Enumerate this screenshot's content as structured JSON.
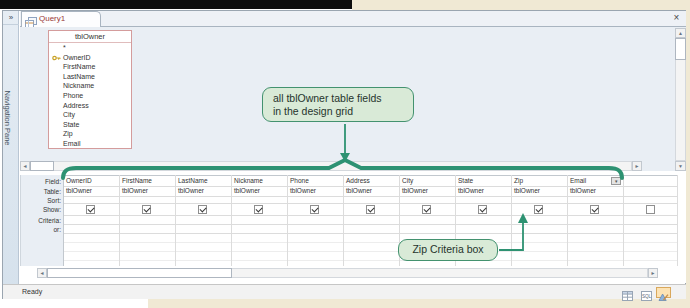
{
  "window": {
    "tab_title": "Query1",
    "navigation_pane_label": "Navigation Pane"
  },
  "icons": {
    "shutter_open": "»",
    "close": "×",
    "scroll_left": "◄",
    "scroll_right": "►",
    "scroll_up": "▲",
    "scroll_down": "▼",
    "dropdown": "▾"
  },
  "field_list": {
    "title": "tblOwner",
    "items": [
      {
        "name": "*",
        "key": false
      },
      {
        "name": "OwnerID",
        "key": true
      },
      {
        "name": "FirstName",
        "key": false
      },
      {
        "name": "LastName",
        "key": false
      },
      {
        "name": "Nickname",
        "key": false
      },
      {
        "name": "Phone",
        "key": false
      },
      {
        "name": "Address",
        "key": false
      },
      {
        "name": "City",
        "key": false
      },
      {
        "name": "State",
        "key": false
      },
      {
        "name": "Zip",
        "key": false
      },
      {
        "name": "Email",
        "key": false
      }
    ]
  },
  "design_grid": {
    "row_labels": [
      "Field:",
      "Table:",
      "Sort:",
      "Show:",
      "Criteria:",
      "or:"
    ],
    "columns": [
      {
        "field": "OwnerID",
        "table": "tblOwner",
        "show": true,
        "has_dropdown": false
      },
      {
        "field": "FirstName",
        "table": "tblOwner",
        "show": true,
        "has_dropdown": false
      },
      {
        "field": "LastName",
        "table": "tblOwner",
        "show": true,
        "has_dropdown": false
      },
      {
        "field": "Nickname",
        "table": "tblOwner",
        "show": true,
        "has_dropdown": false
      },
      {
        "field": "Phone",
        "table": "tblOwner",
        "show": true,
        "has_dropdown": false
      },
      {
        "field": "Address",
        "table": "tblOwner",
        "show": true,
        "has_dropdown": false
      },
      {
        "field": "City",
        "table": "tblOwner",
        "show": true,
        "has_dropdown": false
      },
      {
        "field": "State",
        "table": "tblOwner",
        "show": true,
        "has_dropdown": false
      },
      {
        "field": "Zip",
        "table": "tblOwner",
        "show": true,
        "has_dropdown": false
      },
      {
        "field": "Email",
        "table": "tblOwner",
        "show": true,
        "has_dropdown": true
      },
      {
        "field": "",
        "table": "",
        "show": false,
        "has_dropdown": false
      }
    ]
  },
  "annotations": {
    "callout_fields_line1": "all tblOwner table fields",
    "callout_fields_line2": "in the design grid",
    "callout_zip": "Zip Criteria box",
    "accent_color": "#2e9272",
    "callout_fill": "#d9ead7",
    "callout_border": "#43926f"
  },
  "statusbar": {
    "ready": "Ready",
    "view_buttons": [
      {
        "name": "datasheet-view",
        "active": false
      },
      {
        "name": "sql-view",
        "active": false
      },
      {
        "name": "design-view",
        "active": true
      }
    ]
  },
  "colors": {
    "upper_pane_bg": "#e9eef4",
    "field_list_border": "#d49c9c",
    "tab_title_text": "#9a3a38",
    "page_beige": "#f0e9d4"
  }
}
